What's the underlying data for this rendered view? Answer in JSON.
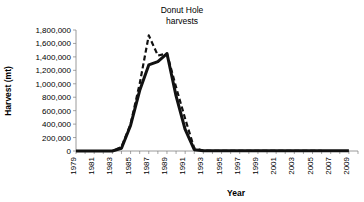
{
  "chart_data": {
    "type": "line",
    "title": "Donut Hole harvests",
    "title_lines": [
      "Donut Hole",
      "harvests"
    ],
    "xlabel": "Year",
    "ylabel": "Harvest (mt)",
    "xlim": [
      1979,
      2010
    ],
    "ylim": [
      0,
      1800000
    ],
    "grid": false,
    "legend": "none",
    "ytick_labels": [
      "0",
      "200,000",
      "400,000",
      "600,000",
      "800,000",
      "1,000,000",
      "1,200,000",
      "1,400,000",
      "1,600,000",
      "1,800,000"
    ],
    "ytick_values": [
      0,
      200000,
      400000,
      600000,
      800000,
      1000000,
      1200000,
      1400000,
      1600000,
      1800000
    ],
    "xtick_labels": [
      "1979",
      "1981",
      "1983",
      "1985",
      "1987",
      "1989",
      "1991",
      "1993",
      "1995",
      "1997",
      "1999",
      "2001",
      "2003",
      "2005",
      "2007",
      "2009"
    ],
    "xtick_values": [
      1979,
      1981,
      1983,
      1985,
      1987,
      1989,
      1991,
      1993,
      1995,
      1997,
      1999,
      2001,
      2003,
      2005,
      2007,
      2009
    ],
    "x": [
      1979,
      1980,
      1981,
      1982,
      1983,
      1984,
      1985,
      1986,
      1987,
      1988,
      1989,
      1990,
      1991,
      1992,
      1993,
      1994,
      1995,
      1996,
      1997,
      1998,
      1999,
      2000,
      2001,
      2002,
      2003,
      2004,
      2005,
      2006,
      2007,
      2008,
      2009
    ],
    "series": [
      {
        "name": "solid-series",
        "style": "solid",
        "color": "#111111",
        "values": [
          0,
          0,
          0,
          0,
          0,
          40000,
          380000,
          900000,
          1280000,
          1330000,
          1450000,
          820000,
          320000,
          20000,
          5000,
          3000,
          3000,
          3000,
          3000,
          3000,
          3000,
          3000,
          3000,
          3000,
          3000,
          3000,
          3000,
          3000,
          3000,
          3000,
          3000
        ]
      },
      {
        "name": "dashed-series",
        "style": "dashed",
        "color": "#111111",
        "values": [
          0,
          0,
          0,
          0,
          0,
          60000,
          400000,
          1000000,
          1720000,
          1420000,
          1450000,
          950000,
          480000,
          40000,
          5000,
          3000,
          3000,
          3000,
          3000,
          3000,
          3000,
          3000,
          3000,
          3000,
          3000,
          3000,
          3000,
          3000,
          null,
          null,
          null
        ]
      }
    ],
    "peak_solid": {
      "year": 1989,
      "value": 1450000
    },
    "peak_dashed": {
      "year": 1987,
      "value": 1720000
    }
  }
}
